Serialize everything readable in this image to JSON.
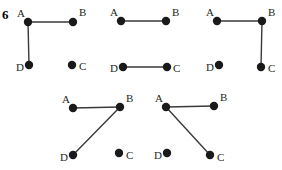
{
  "figure": {
    "number": "6",
    "width": 282,
    "height": 170,
    "background_color": "#ffffff",
    "ink_color": "#231f20",
    "node_color": "#1a1a1a",
    "edge_color": "#3a3a3a"
  },
  "graphs": [
    {
      "id": "graph-1",
      "nodes": [
        {
          "id": "A",
          "label": "A",
          "cx": 28,
          "cy": 22,
          "r": 4.2,
          "label_x": 17,
          "label_y": 17
        },
        {
          "id": "B",
          "label": "B",
          "cx": 73,
          "cy": 22,
          "r": 4.2,
          "label_x": 79,
          "label_y": 16
        },
        {
          "id": "C",
          "label": "C",
          "cx": 72,
          "cy": 65,
          "r": 4.2,
          "label_x": 79,
          "label_y": 70
        },
        {
          "id": "D",
          "label": "D",
          "cx": 29,
          "cy": 65,
          "r": 4.2,
          "label_x": 16,
          "label_y": 71
        }
      ],
      "edges": [
        {
          "from": "A",
          "to": "B"
        },
        {
          "from": "A",
          "to": "D"
        }
      ]
    },
    {
      "id": "graph-2",
      "nodes": [
        {
          "id": "A",
          "label": "A",
          "cx": 121,
          "cy": 21,
          "r": 4.2,
          "label_x": 110,
          "label_y": 16
        },
        {
          "id": "B",
          "label": "B",
          "cx": 166,
          "cy": 21,
          "r": 4.2,
          "label_x": 172,
          "label_y": 16
        },
        {
          "id": "C",
          "label": "C",
          "cx": 167,
          "cy": 67,
          "r": 4.2,
          "label_x": 173,
          "label_y": 72
        },
        {
          "id": "D",
          "label": "D",
          "cx": 123,
          "cy": 67,
          "r": 4.2,
          "label_x": 110,
          "label_y": 72
        }
      ],
      "edges": [
        {
          "from": "A",
          "to": "B"
        },
        {
          "from": "D",
          "to": "C"
        }
      ]
    },
    {
      "id": "graph-3",
      "nodes": [
        {
          "id": "A",
          "label": "A",
          "cx": 217,
          "cy": 21,
          "r": 4.2,
          "label_x": 206,
          "label_y": 16
        },
        {
          "id": "B",
          "label": "B",
          "cx": 262,
          "cy": 21,
          "r": 4.2,
          "label_x": 268,
          "label_y": 16
        },
        {
          "id": "C",
          "label": "C",
          "cx": 261,
          "cy": 67,
          "r": 4.2,
          "label_x": 268,
          "label_y": 72
        },
        {
          "id": "D",
          "label": "D",
          "cx": 219,
          "cy": 65,
          "r": 4.2,
          "label_x": 206,
          "label_y": 71
        }
      ],
      "edges": [
        {
          "from": "A",
          "to": "B"
        },
        {
          "from": "B",
          "to": "C"
        }
      ]
    },
    {
      "id": "graph-4",
      "nodes": [
        {
          "id": "A",
          "label": "A",
          "cx": 73,
          "cy": 108,
          "r": 4.2,
          "label_x": 62,
          "label_y": 103
        },
        {
          "id": "B",
          "label": "B",
          "cx": 120,
          "cy": 107,
          "r": 4.2,
          "label_x": 126,
          "label_y": 102
        },
        {
          "id": "C",
          "label": "C",
          "cx": 119,
          "cy": 153,
          "r": 4.2,
          "label_x": 126,
          "label_y": 159
        },
        {
          "id": "D",
          "label": "D",
          "cx": 73,
          "cy": 155,
          "r": 4.2,
          "label_x": 60,
          "label_y": 161
        }
      ],
      "edges": [
        {
          "from": "A",
          "to": "B"
        },
        {
          "from": "B",
          "to": "D"
        }
      ]
    },
    {
      "id": "graph-5",
      "nodes": [
        {
          "id": "A",
          "label": "A",
          "cx": 166,
          "cy": 107,
          "r": 4.2,
          "label_x": 155,
          "label_y": 102
        },
        {
          "id": "B",
          "label": "B",
          "cx": 214,
          "cy": 106,
          "r": 4.2,
          "label_x": 220,
          "label_y": 101
        },
        {
          "id": "C",
          "label": "C",
          "cx": 210,
          "cy": 155,
          "r": 4.2,
          "label_x": 217,
          "label_y": 161
        },
        {
          "id": "D",
          "label": "D",
          "cx": 167,
          "cy": 153,
          "r": 4.2,
          "label_x": 154,
          "label_y": 159
        }
      ],
      "edges": [
        {
          "from": "A",
          "to": "B"
        },
        {
          "from": "A",
          "to": "C"
        }
      ]
    }
  ]
}
